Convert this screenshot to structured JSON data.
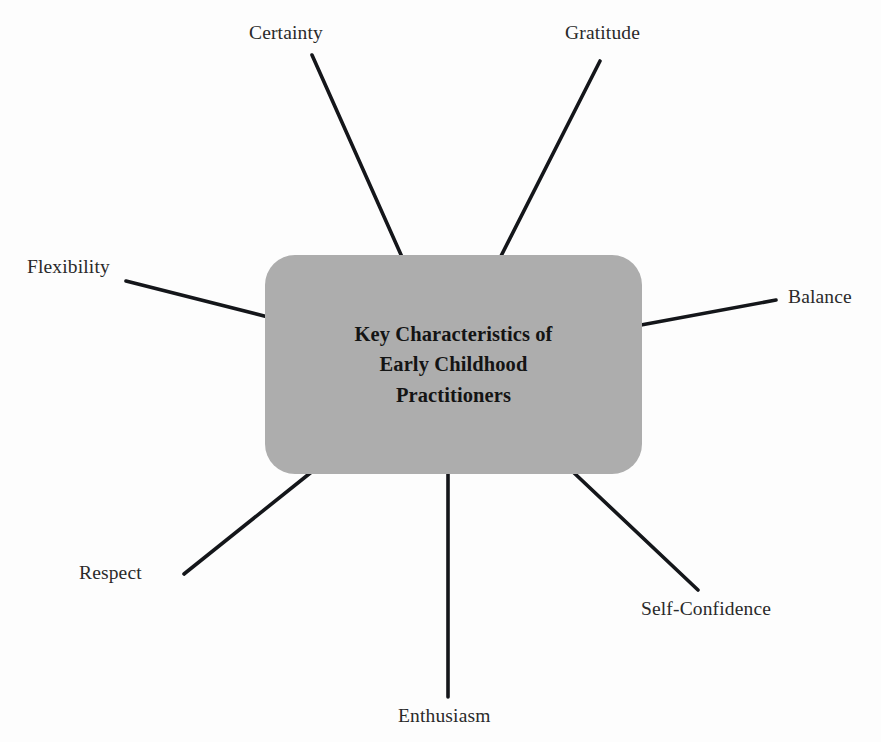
{
  "diagram": {
    "type": "spoke-diagram",
    "center": {
      "title": "Key Characteristics of\nEarly Childhood\nPractitioners",
      "fill_color": "#adadad",
      "text_color": "#141414"
    },
    "line_color": "#14161a",
    "background_color": "#fdfdfd",
    "spokes": [
      {
        "id": "certainty",
        "label": "Certainty",
        "x1": 312,
        "y1": 55,
        "x2": 402,
        "y2": 257
      },
      {
        "id": "gratitude",
        "label": "Gratitude",
        "x1": 600,
        "y1": 61,
        "x2": 501,
        "y2": 256
      },
      {
        "id": "flexibility",
        "label": "Flexibility",
        "x1": 126,
        "y1": 281,
        "x2": 268,
        "y2": 317
      },
      {
        "id": "balance",
        "label": "Balance",
        "x1": 776,
        "y1": 300,
        "x2": 641,
        "y2": 325
      },
      {
        "id": "respect",
        "label": "Respect",
        "x1": 184,
        "y1": 574,
        "x2": 314,
        "y2": 470
      },
      {
        "id": "self-confidence",
        "label": "Self-Confidence",
        "x1": 698,
        "y1": 590,
        "x2": 572,
        "y2": 471
      },
      {
        "id": "enthusiasm",
        "label": "Enthusiasm",
        "x1": 448,
        "y1": 697,
        "x2": 448,
        "y2": 473
      }
    ]
  }
}
